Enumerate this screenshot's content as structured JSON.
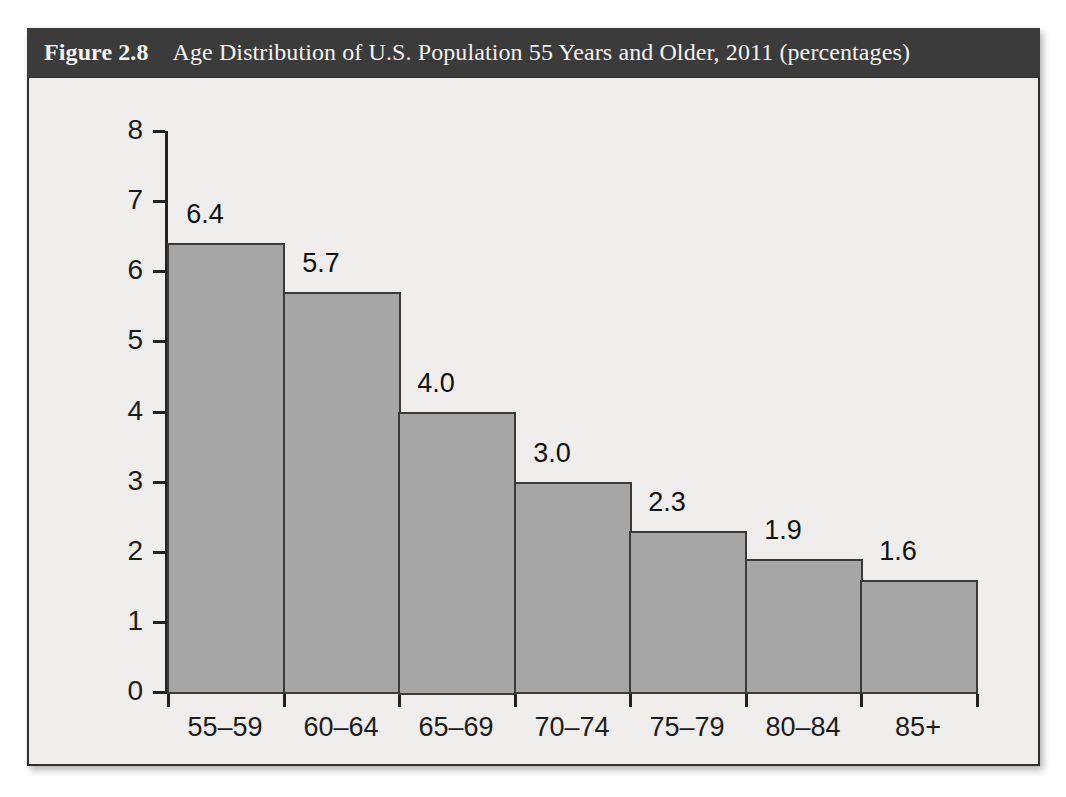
{
  "figure": {
    "label": "Figure 2.8",
    "title": "Age Distribution of U.S. Population 55 Years and Older, 2011 (percentages)"
  },
  "colors": {
    "header_bg": "#3b3b3b",
    "header_text": "#f4f3f1",
    "panel_bg": "#efeeec",
    "bar_fill": "#a6a6a6",
    "bar_stroke": "#3a3a3a",
    "axis": "#222222",
    "text": "#1c1c1c"
  },
  "chart_data": {
    "type": "bar",
    "title": "Age Distribution of U.S. Population 55 Years and Older, 2011 (percentages)",
    "xlabel": "",
    "ylabel": "",
    "categories": [
      "55–59",
      "60–64",
      "65–69",
      "70–74",
      "75–79",
      "80–84",
      "85+"
    ],
    "values": [
      6.4,
      5.7,
      4.0,
      3.0,
      2.3,
      1.9,
      1.6
    ],
    "value_labels": [
      "6.4",
      "5.7",
      "4.0",
      "3.0",
      "2.3",
      "1.9",
      "1.6"
    ],
    "ylim": [
      0,
      8
    ],
    "ytick_values": [
      0,
      1,
      2,
      3,
      4,
      5,
      6,
      7,
      8
    ],
    "ytick_labels": [
      "0",
      "1",
      "2",
      "3",
      "4",
      "5",
      "6",
      "7",
      "8"
    ],
    "grid": false,
    "legend": false,
    "bars_contiguous": true
  }
}
